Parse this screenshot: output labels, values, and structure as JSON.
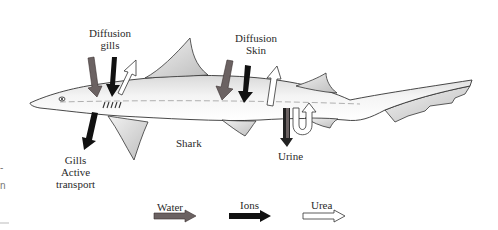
{
  "diagram": {
    "subject": "Shark",
    "labels": {
      "diffusion_gills": [
        "Diffusion",
        "gills"
      ],
      "diffusion_skin": [
        "Diffusion",
        "Skin"
      ],
      "gills_active": [
        "Gills",
        "Active",
        "transport"
      ],
      "shark": "Shark",
      "urine": "Urine"
    },
    "legend": [
      {
        "label": "Water",
        "color": "#6b6262",
        "style": "gray-filled-arrow"
      },
      {
        "label": "Ions",
        "color": "#111111",
        "style": "black-filled-arrow"
      },
      {
        "label": "Urea",
        "color": "#ffffff",
        "style": "white-outlined-arrow"
      }
    ],
    "edge_fragments": [
      "-",
      "n"
    ]
  }
}
